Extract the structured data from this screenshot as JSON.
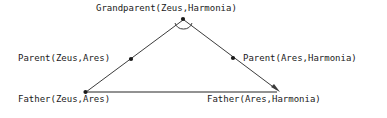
{
  "diagram": {
    "type": "triangle-relation-diagram",
    "stroke_color": "#3c3c3c",
    "text_color": "#1a1a1a",
    "background_color": "#ffffff",
    "apex": {
      "label": "Grandparent(Zeus,Harmonia)",
      "marker": "vertex-dot",
      "angle_arc": "arc-marker"
    },
    "edges": {
      "left": {
        "label": "Parent(Zeus,Ares)",
        "marker": "midpoint-dot"
      },
      "right": {
        "label": "Parent(Ares,Harmonia)",
        "marker": "midpoint-dot"
      }
    },
    "base": {
      "left_vertex": {
        "label": "Father(Zeus,Ares)",
        "marker": "vertex-dot"
      },
      "right_vertex": {
        "label": "Father(Ares,Harmonia)",
        "marker": "arrowhead"
      }
    },
    "geometry": {
      "apex_x": 183,
      "apex_y": 19,
      "base_left_x": 85,
      "base_left_y": 92,
      "base_right_x": 279,
      "base_right_y": 92,
      "left_mid_x": 131,
      "left_mid_y": 59,
      "right_mid_x": 233,
      "right_mid_y": 58
    }
  }
}
